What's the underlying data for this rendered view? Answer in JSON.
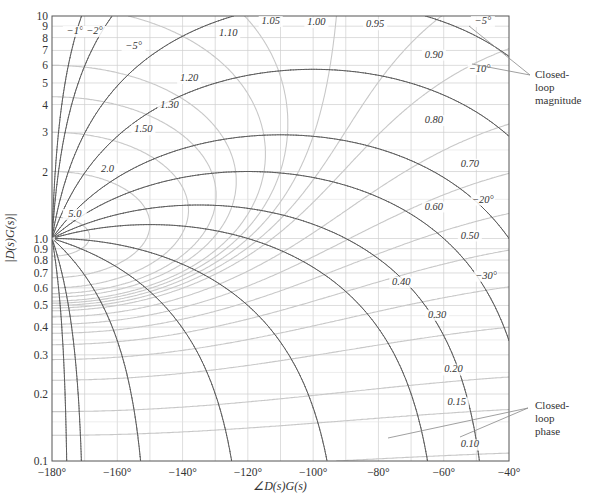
{
  "chart_data": {
    "type": "line",
    "title": "",
    "xlabel": "∠D(s)G(s)",
    "ylabel": "|D(s)G(s)|",
    "xlim": [
      -180,
      -40
    ],
    "ylim": [
      0.1,
      10
    ],
    "yscale": "log",
    "grid": true,
    "x_ticks": [
      "-180°",
      "-160°",
      "-140°",
      "-120°",
      "-100°",
      "-80°",
      "-60°",
      "-40°"
    ],
    "x_tick_values": [
      -180,
      -160,
      -140,
      -120,
      -100,
      -80,
      -60,
      -40
    ],
    "y_ticks": [
      "10",
      "9",
      "8",
      "7",
      "6",
      "5",
      "4",
      "3",
      "2",
      "1.0",
      "0.9",
      "0.8",
      "0.7",
      "0.6",
      "0.5",
      "0.4",
      "0.3",
      "0.2",
      "0.1"
    ],
    "y_tick_values": [
      10,
      9,
      8,
      7,
      6,
      5,
      4,
      3,
      2,
      1.0,
      0.9,
      0.8,
      0.7,
      0.6,
      0.5,
      0.4,
      0.3,
      0.2,
      0.1
    ],
    "closed_loop_magnitude_contours": [
      {
        "label": "5.0",
        "M": 5.0,
        "label_at": [
          -173,
          1.25
        ]
      },
      {
        "label": "2.0",
        "M": 2.0,
        "label_at": [
          -163,
          2.0
        ]
      },
      {
        "label": "1.50",
        "M": 1.5,
        "label_at": [
          -152,
          3.0
        ]
      },
      {
        "label": "1.30",
        "M": 1.3,
        "label_at": [
          -144,
          3.85
        ]
      },
      {
        "label": "1.20",
        "M": 1.2,
        "label_at": [
          -138,
          5.1
        ]
      },
      {
        "label": "1.10",
        "M": 1.1,
        "label_at": [
          -126,
          8.1
        ]
      },
      {
        "label": "1.05",
        "M": 1.05,
        "label_at": [
          -113,
          9.2
        ]
      },
      {
        "label": "1.00",
        "M": 1.0,
        "label_at": [
          -99,
          9.1
        ]
      },
      {
        "label": "0.95",
        "M": 0.95,
        "label_at": [
          -81,
          8.9
        ]
      },
      {
        "label": "0.90",
        "M": 0.9,
        "label_at": [
          -63,
          6.5
        ]
      },
      {
        "label": "0.80",
        "M": 0.8,
        "label_at": [
          -63,
          3.3
        ]
      },
      {
        "label": "0.70",
        "M": 0.7,
        "label_at": [
          -52,
          2.1
        ]
      },
      {
        "label": "0.60",
        "M": 0.6,
        "label_at": [
          -63,
          1.35
        ]
      },
      {
        "label": "0.50",
        "M": 0.5,
        "label_at": [
          -52,
          1.0
        ]
      },
      {
        "label": "0.40",
        "M": 0.4,
        "label_at": [
          -73,
          0.62
        ]
      },
      {
        "label": "0.30",
        "M": 0.3,
        "label_at": [
          -62,
          0.44
        ]
      },
      {
        "label": "0.20",
        "M": 0.2,
        "label_at": [
          -57,
          0.25
        ]
      },
      {
        "label": "0.15",
        "M": 0.15,
        "label_at": [
          -56,
          0.178
        ]
      },
      {
        "label": "0.10",
        "M": 0.1,
        "label_at": [
          -52,
          0.115
        ]
      }
    ],
    "closed_loop_phase_contours": [
      {
        "label": "−1°",
        "N": -1,
        "label_at": [
          -173,
          8.3
        ]
      },
      {
        "label": "−2°",
        "N": -2,
        "label_at": [
          -167,
          8.3
        ]
      },
      {
        "label": "−5°",
        "N": -5,
        "label_at": [
          -155,
          7.1
        ]
      },
      {
        "label": "−5°",
        "N": -5,
        "label_at": [
          -48,
          9.2
        ],
        "branch": "right"
      },
      {
        "label": "−10°",
        "N": -10,
        "label_at": [
          -49,
          5.6
        ]
      },
      {
        "label": "−20°",
        "N": -20,
        "label_at": [
          -48,
          1.45
        ]
      },
      {
        "label": "−30°",
        "N": -30,
        "label_at": [
          -47,
          0.66
        ]
      },
      {
        "label": "",
        "N": -45
      },
      {
        "label": "",
        "N": -60
      },
      {
        "label": "",
        "N": -90
      },
      {
        "label": "",
        "N": -120
      },
      {
        "label": "",
        "N": -150
      },
      {
        "label": "",
        "N": -170
      },
      {
        "label": "",
        "N": -175
      }
    ],
    "annotations": [
      {
        "text": [
          "Closed-",
          "loop",
          "magnitude"
        ],
        "points_to": "closed-loop magnitude contours (0.95, 0.90)"
      },
      {
        "text": [
          "Closed-",
          "loop",
          "phase"
        ],
        "points_to": "closed-loop phase contours"
      }
    ],
    "legend": "none"
  },
  "labels": {
    "xlabel": "∠D(s)G(s)",
    "ylabel": "|D(s)G(s)|",
    "annotation_magnitude": [
      "Closed-",
      "loop",
      "magnitude"
    ],
    "annotation_phase": [
      "Closed-",
      "loop",
      "phase"
    ]
  },
  "colors": {
    "phase_contour": "#555555",
    "magnitude_contour": "#c8c8c8",
    "grid": "#cfcfcf",
    "frame": "#555555",
    "text": "#333333"
  }
}
